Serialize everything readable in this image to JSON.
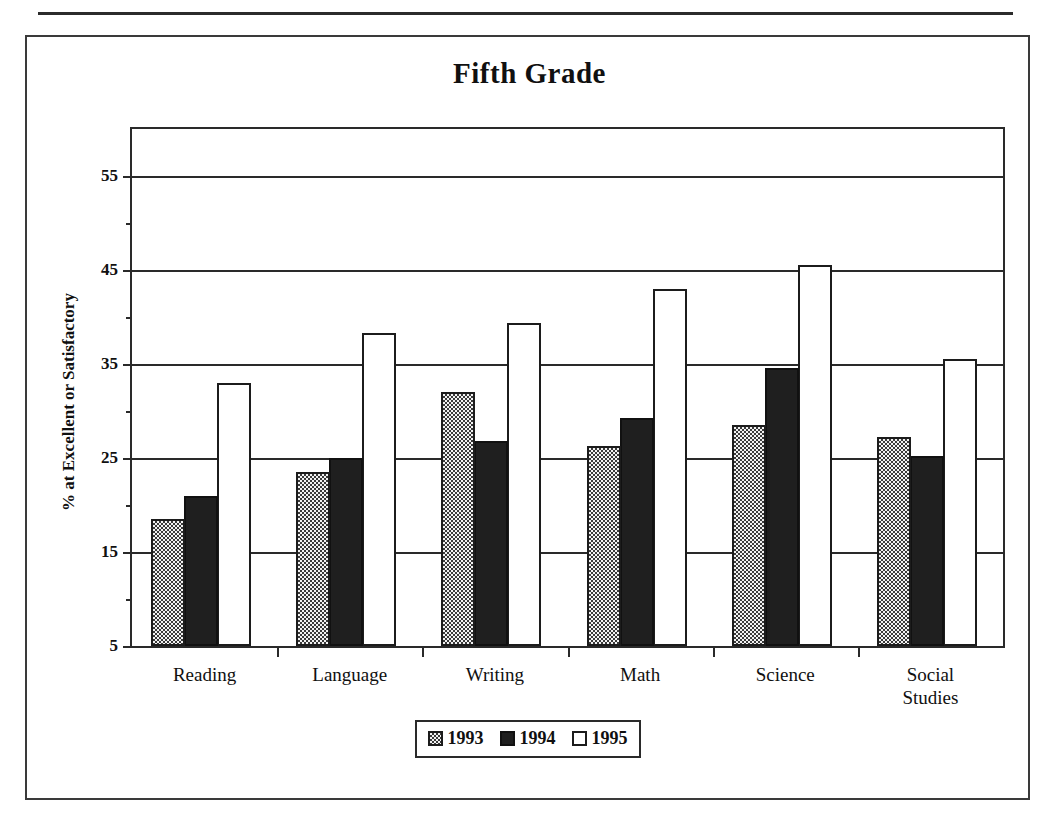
{
  "figure": {
    "title": "Fifth Grade"
  },
  "chart_data": {
    "type": "bar",
    "title": "Fifth Grade",
    "xlabel": "",
    "ylabel": "% at Excellent or Satisfactory",
    "ylim": [
      5,
      60
    ],
    "yticks": [
      5,
      15,
      25,
      35,
      45,
      55
    ],
    "ytick_labels": [
      "5",
      "15",
      "25",
      "35",
      "45",
      "55"
    ],
    "yminor_ticks": [
      10,
      20,
      30,
      40,
      50
    ],
    "grid": true,
    "grid_axis": "y",
    "legend_position": "bottom",
    "categories": [
      "Reading",
      "Language",
      "Writing",
      "Math",
      "Science",
      "Social\nStudies"
    ],
    "series": [
      {
        "name": "1993",
        "fill": "checkered",
        "color": "#d9d9d9",
        "values": [
          18.5,
          23.5,
          32.0,
          26.3,
          28.5,
          27.2
        ]
      },
      {
        "name": "1994",
        "fill": "solid",
        "color": "#1f1f1f",
        "values": [
          21.0,
          25.0,
          26.8,
          29.3,
          34.6,
          25.2
        ]
      },
      {
        "name": "1995",
        "fill": "open",
        "color": "#ffffff",
        "values": [
          33.0,
          38.3,
          39.4,
          43.0,
          45.5,
          35.5
        ]
      }
    ]
  },
  "legend": {
    "items": [
      {
        "label": "1993"
      },
      {
        "label": "1994"
      },
      {
        "label": "1995"
      }
    ]
  }
}
